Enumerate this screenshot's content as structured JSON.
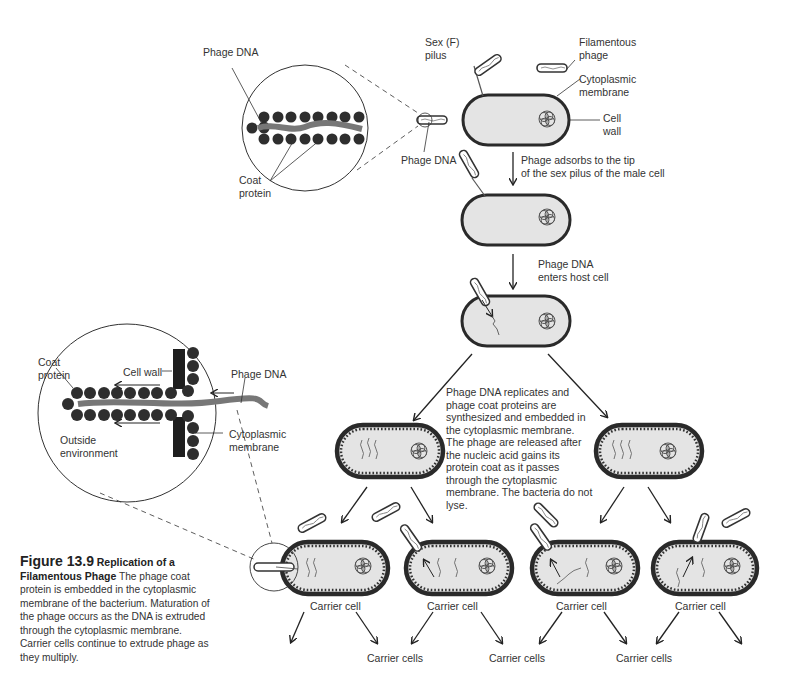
{
  "figure": {
    "number_label": "Figure 13.9",
    "title": "Replication of a Filamentous Phage",
    "caption": "The phage coat protein is embedded in the cytoplasmic membrane of the bacterium. Maturation of the phage occurs as the DNA is extruded through the cytoplasmic membrane. Carrier cells continue to extrude phage as they multiply."
  },
  "inset_top": {
    "phage_dna_label": "Phage DNA",
    "coat_protein_label": "Coat\nprotein"
  },
  "inset_bottom": {
    "coat_protein_label": "Coat\nprotein",
    "cell_wall_label": "Cell wall",
    "phage_dna_label": "Phage DNA",
    "outside_label": "Outside\nenvironment",
    "cytoplasmic_membrane_label": "Cytoplasmic\nmembrane"
  },
  "top_cell": {
    "sex_pilus_label": "Sex (F)\npilus",
    "filamentous_phage_label": "Filamentous\nphage",
    "cytoplasmic_membrane_label": "Cytoplasmic\nmembrane",
    "cell_wall_label": "Cell\nwall",
    "phage_dna_label": "Phage DNA"
  },
  "steps": {
    "adsorb": "Phage adsorbs to the tip\nof the sex pilus of the male cell",
    "enters": "Phage DNA\nenters host cell",
    "replicates": "Phage DNA replicates and phage coat proteins are synthesized and embedded in the cytoplasmic membrane. The phage are released after the nucleic acid gains its protein coat as it passes through the cytoplasmic membrane. The bacteria do not lyse."
  },
  "carrier": {
    "cell_label": "Carrier cell",
    "cells_label": "Carrier cells"
  },
  "colors": {
    "cell_fill": "#e4e4e4",
    "cell_wall": "#2a2a2a",
    "protein": "#333333",
    "dna": "#777777"
  }
}
